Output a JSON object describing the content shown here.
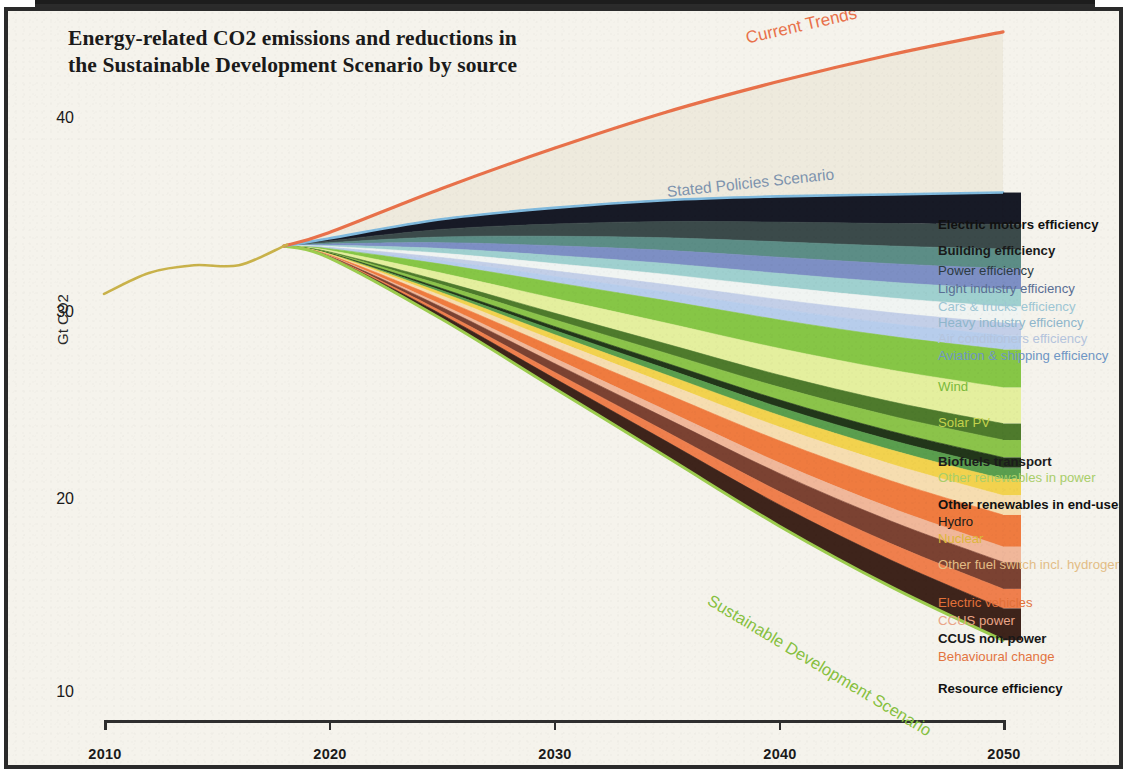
{
  "title": "Energy-related CO2 emissions and reductions in the Sustainable Development Scenario by source",
  "title_line1": "Energy-related CO2 emissions and reductions in",
  "title_line2": "the Sustainable Development Scenario by source",
  "axes": {
    "ylabel": "Gt CO2",
    "yticks": [
      "40",
      "30",
      "20",
      "10"
    ],
    "xticks": [
      "2010",
      "2020",
      "2030",
      "2040",
      "2050"
    ]
  },
  "annotations": {
    "current_trends": "Current Trends",
    "stated_policies": "Stated Policies Scenario",
    "sustainable_development": "Sustainable Development Scenario"
  },
  "colors": {
    "current_trends_line": "#e8714a",
    "stated_policies_line": "#7fb9dd",
    "sds_line": "#9ccc4e",
    "history_line": "#c9b24a",
    "paper": "#f5f3ec",
    "frame": "#2a2a2a",
    "axis": "#2e2e2e"
  },
  "legend": {
    "items": [
      {
        "label": "Electric motors efficiency",
        "color": "#171a26",
        "text_color": "#111111",
        "bold": true
      },
      {
        "label": "Building efficiency",
        "color": "#3b4a4a",
        "text_color": "#1a1a1a",
        "bold": true
      },
      {
        "label": "Power efficiency",
        "color": "#5c8d86",
        "text_color": "#2c3b42",
        "bold": false
      },
      {
        "label": "Light industry efficiency",
        "color": "#7d8fc4",
        "text_color": "#5a6e94",
        "bold": false
      },
      {
        "label": "Cars & trucks efficiency",
        "color": "#9fd0cf",
        "text_color": "#9dc6d4",
        "bold": false
      },
      {
        "label": "Heavy industry efficiency",
        "color": "#f0f4f2",
        "text_color": "#8fb6cb",
        "bold": false
      },
      {
        "label": "Air conditioners efficiency",
        "color": "#c3cfe8",
        "text_color": "#b4c4dd",
        "bold": false
      },
      {
        "label": "Aviation & shipping efficiency",
        "color": "#b7cdec",
        "text_color": "#6f96c4",
        "bold": false
      },
      {
        "label": "Wind",
        "color": "#86c646",
        "text_color": "#79b93b",
        "bold": false
      },
      {
        "label": "Solar PV",
        "color": "#e4ef9e",
        "text_color": "#c4d24d",
        "bold": false
      },
      {
        "label": "Biofuels transport",
        "color": "#4e7a2c",
        "text_color": "#1c1c1c",
        "bold": true
      },
      {
        "label": "Other renewables in power",
        "color": "#8bc34a",
        "text_color": "#a9ce6a",
        "bold": false
      },
      {
        "label": "Other renewables in end-uses",
        "color": "#22361a",
        "text_color": "#111111",
        "bold": true
      },
      {
        "label": "Hydro",
        "color": "#5a9e4e",
        "text_color": "#1a1a1a",
        "bold": false
      },
      {
        "label": "Nuclear",
        "color": "#f2d24e",
        "text_color": "#dcb63a",
        "bold": false
      },
      {
        "label": "Other fuel switch incl. hydrogen",
        "color": "#f6ddb0",
        "text_color": "#e3bd86",
        "bold": false
      },
      {
        "label": "Electric vehicles",
        "color": "#ef7b3f",
        "text_color": "#e2713a",
        "bold": false
      },
      {
        "label": "CCUS power",
        "color": "#f0b79a",
        "text_color": "#eaa487",
        "bold": false
      },
      {
        "label": "CCUS non-power",
        "color": "#7b4232",
        "text_color": "#181818",
        "bold": true
      },
      {
        "label": "Behavioural change",
        "color": "#ef7f4d",
        "text_color": "#e3743f",
        "bold": false
      },
      {
        "label": "Resource efficiency",
        "color": "#3e241b",
        "text_color": "#111111",
        "bold": true
      }
    ]
  },
  "chart_data": {
    "type": "area",
    "title": "Energy-related CO2 emissions and reductions in the Sustainable Development Scenario by source",
    "xlabel": "",
    "ylabel": "Gt CO2",
    "xlim": [
      2010,
      2050
    ],
    "ylim": [
      7.5,
      44
    ],
    "grid": false,
    "legend_position": "right",
    "x": [
      2010,
      2015,
      2018,
      2020,
      2025,
      2030,
      2035,
      2040,
      2045,
      2050
    ],
    "history": {
      "name": "Historical emissions",
      "x": [
        2010,
        2012,
        2014,
        2016,
        2018
      ],
      "values": [
        30.7,
        31.8,
        32.2,
        32.2,
        33.2
      ],
      "color": "#c9b24a"
    },
    "boundaries": [
      {
        "name": "Current Trends",
        "values": [
          null,
          null,
          33.2,
          33.9,
          36.2,
          38.3,
          40.2,
          41.8,
          43.2,
          44.4
        ],
        "color": "#e8714a"
      },
      {
        "name": "Stated Policies Scenario",
        "values": [
          null,
          null,
          33.2,
          33.6,
          34.6,
          35.2,
          35.6,
          35.8,
          35.9,
          36.0
        ],
        "color": "#7fb9dd"
      },
      {
        "name": "Sustainable Development Scenario",
        "values": [
          null,
          null,
          33.2,
          32.6,
          29.4,
          25.8,
          22.2,
          18.6,
          15.4,
          12.6
        ],
        "color": "#9ccc4e"
      }
    ],
    "wedges_2050_gt": [
      {
        "name": "Electric motors efficiency",
        "value": 1.55
      },
      {
        "name": "Building efficiency",
        "value": 1.2
      },
      {
        "name": "Power efficiency",
        "value": 0.95
      },
      {
        "name": "Light industry efficiency",
        "value": 1.0
      },
      {
        "name": "Cars & trucks efficiency",
        "value": 0.85
      },
      {
        "name": "Heavy industry efficiency",
        "value": 0.8
      },
      {
        "name": "Air conditioners efficiency",
        "value": 0.6
      },
      {
        "name": "Aviation & shipping efficiency",
        "value": 0.7
      },
      {
        "name": "Wind",
        "value": 1.85
      },
      {
        "name": "Solar PV",
        "value": 1.75
      },
      {
        "name": "Biofuels transport",
        "value": 0.8
      },
      {
        "name": "Other renewables in power",
        "value": 0.85
      },
      {
        "name": "Other renewables in end-uses",
        "value": 0.5
      },
      {
        "name": "Hydro",
        "value": 0.55
      },
      {
        "name": "Nuclear",
        "value": 0.8
      },
      {
        "name": "Other fuel switch incl. hydrogen",
        "value": 0.95
      },
      {
        "name": "Electric vehicles",
        "value": 1.55
      },
      {
        "name": "CCUS power",
        "value": 0.75
      },
      {
        "name": "CCUS non-power",
        "value": 1.3
      },
      {
        "name": "Behavioural change",
        "value": 0.95
      },
      {
        "name": "Resource efficiency",
        "value": 1.55
      }
    ]
  }
}
